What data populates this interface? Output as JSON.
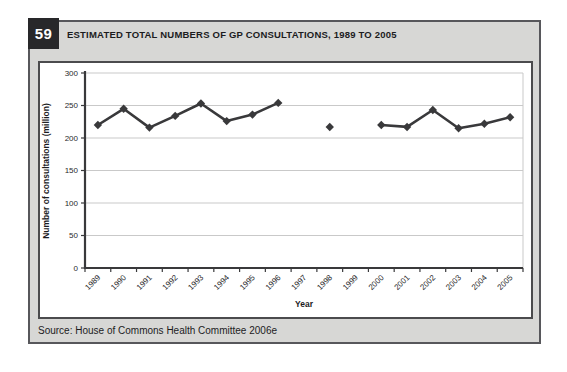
{
  "figure": {
    "number": "59",
    "title": "ESTIMATED TOTAL NUMBERS OF GP CONSULTATIONS, 1989 TO 2005"
  },
  "source": {
    "text": "Source: House of Commons Health Committee 2006e"
  },
  "colors": {
    "card_background": "#d7d7d5",
    "card_border": "#57575b",
    "badge_background": "#28282a",
    "badge_text": "#ffffff",
    "panel_border": "#4b4b4d",
    "axis": "#39393b",
    "grid": "#c9c9c9",
    "line": "#39393b",
    "tick_label": "#2a2a2c"
  },
  "chart_data": {
    "type": "line",
    "title": "ESTIMATED TOTAL NUMBERS OF GP CONSULTATIONS, 1989 TO 2005",
    "xlabel": "Year",
    "ylabel": "Number of consultations (million)",
    "categories": [
      "1989",
      "1990",
      "1991",
      "1992",
      "1993",
      "1994",
      "1995",
      "1996",
      "1997",
      "1998",
      "1999",
      "2000",
      "2001",
      "2002",
      "2003",
      "2004",
      "2005"
    ],
    "values": [
      220,
      245,
      216,
      234,
      253,
      226,
      236,
      254,
      null,
      217,
      null,
      220,
      217,
      243,
      215,
      222,
      232
    ],
    "missing_years": [
      "1997",
      "1999"
    ],
    "ylim": [
      0,
      300
    ],
    "ytick_step": 50,
    "grid": true,
    "legend": "none",
    "marker": "diamond"
  }
}
